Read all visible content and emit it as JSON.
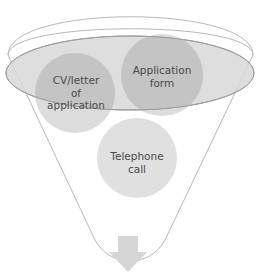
{
  "diagram": {
    "type": "funnel",
    "colors": {
      "funnel_outline": "#b8b8b8",
      "funnel_fill": "#ffffff",
      "ellipse_fill": "#dedede",
      "ellipse_stroke": "#a0a0a0",
      "circle_dark": "#c4c4c4",
      "circle_light": "#dcdcdc",
      "arrow_fill": "#d6d6d6",
      "text": "#4a4a4a"
    },
    "items": [
      {
        "label": "CV/letter\nof\napplication"
      },
      {
        "label": "Application\nform"
      },
      {
        "label": "Telephone\ncall"
      }
    ],
    "output_arrow": "down-arrow"
  }
}
